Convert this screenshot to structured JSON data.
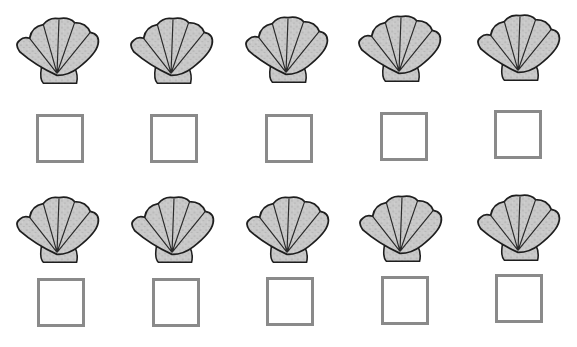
{
  "worksheet": {
    "colors": {
      "shell_fill": "#c9c9c9",
      "shell_outline": "#1e1e1e",
      "box_border": "#8a8a8a"
    },
    "rows": [
      {
        "items": [
          {
            "shell": {
              "x": 14,
              "y": 14
            },
            "box": {
              "x": 36,
              "y": 114
            }
          },
          {
            "shell": {
              "x": 128,
              "y": 14
            },
            "box": {
              "x": 150,
              "y": 114
            }
          },
          {
            "shell": {
              "x": 243,
              "y": 13
            },
            "box": {
              "x": 265,
              "y": 114
            }
          },
          {
            "shell": {
              "x": 356,
              "y": 12
            },
            "box": {
              "x": 380,
              "y": 112
            }
          },
          {
            "shell": {
              "x": 475,
              "y": 11
            },
            "box": {
              "x": 494,
              "y": 110
            }
          }
        ]
      },
      {
        "items": [
          {
            "shell": {
              "x": 14,
              "y": 193
            },
            "box": {
              "x": 37,
              "y": 278
            }
          },
          {
            "shell": {
              "x": 129,
              "y": 193
            },
            "box": {
              "x": 152,
              "y": 278
            }
          },
          {
            "shell": {
              "x": 244,
              "y": 193
            },
            "box": {
              "x": 266,
              "y": 277
            }
          },
          {
            "shell": {
              "x": 357,
              "y": 192
            },
            "box": {
              "x": 381,
              "y": 276
            }
          },
          {
            "shell": {
              "x": 475,
              "y": 191
            },
            "box": {
              "x": 495,
              "y": 274
            }
          }
        ]
      }
    ]
  }
}
